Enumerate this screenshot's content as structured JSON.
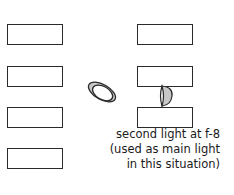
{
  "diagram": {
    "left_boxes": [
      {
        "x": 7,
        "y": 24
      },
      {
        "x": 7,
        "y": 66
      },
      {
        "x": 7,
        "y": 107
      },
      {
        "x": 7,
        "y": 148
      }
    ],
    "right_boxes": [
      {
        "x": 137,
        "y": 24
      },
      {
        "x": 137,
        "y": 66
      },
      {
        "x": 137,
        "y": 107
      }
    ],
    "caption": {
      "line1": "second light at f-8",
      "line2": "(used as main light",
      "line3": "in this situation)"
    },
    "colors": {
      "stroke": "#2a2a2a",
      "light_fill": "#c8c8c8",
      "background": "#ffffff"
    }
  }
}
